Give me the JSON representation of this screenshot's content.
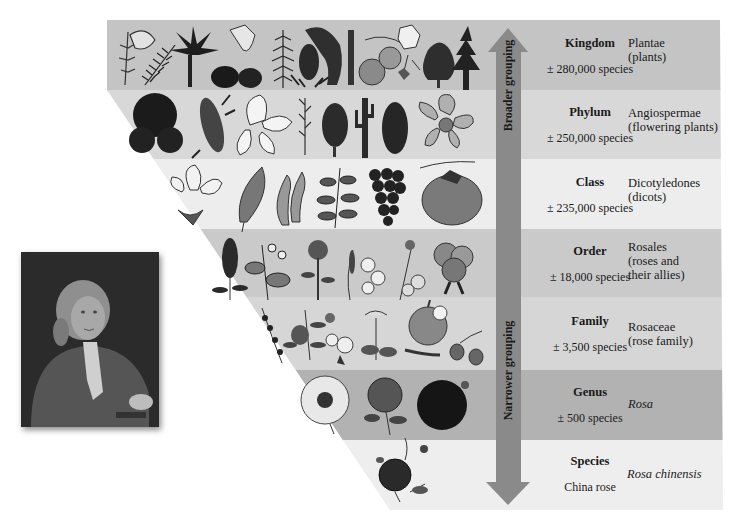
{
  "figure": {
    "arrow": {
      "top_label": "Broader grouping",
      "bottom_label": "Narrower grouping",
      "color": "#8a8a8a"
    },
    "portrait": {
      "subject": "portrait-of-linnaeus",
      "description": "18th-century painted portrait of a man with a powdered wig"
    },
    "levels": [
      {
        "rank": "Kingdom",
        "count": "± 280,000 species",
        "taxon_line1": "Plantae",
        "taxon_line2": "(plants)",
        "taxon_line3": "",
        "italic": false,
        "color": "#c4c4c4",
        "illustrations": [
          "moss-sprig",
          "fern-frond",
          "palm-tree",
          "horsetail-cone",
          "conifer-branch",
          "pineapple",
          "cycad-cone",
          "orange-fruit",
          "orchid-flower",
          "pine-cone",
          "spruce-tree"
        ]
      },
      {
        "rank": "Phylum",
        "count": "± 250,000 species",
        "taxon_line1": "Angiospermae",
        "taxon_line2": "(flowering plants)",
        "taxon_line3": "",
        "italic": false,
        "color": "#d8d8d8",
        "illustrations": [
          "fan-palm",
          "corn-cob",
          "lily-flower",
          "grass-spike",
          "pine-cone",
          "saguaro-cactus",
          "fir-cone",
          "orchid-bloom"
        ]
      },
      {
        "rank": "Class",
        "count": "± 235,000 species",
        "taxon_line1": "Dicotyledones",
        "taxon_line2": "(dicots)",
        "taxon_line3": "",
        "italic": false,
        "color": "#ededed",
        "illustrations": [
          "magnolia-flower",
          "beech-leaf",
          "bean-pod",
          "leafy-branch",
          "grape-cluster",
          "persimmon-fruit"
        ]
      },
      {
        "rank": "Order",
        "count": "± 18,000 species",
        "taxon_line1": "Rosales",
        "taxon_line2": "(roses and",
        "taxon_line3": "their allies)",
        "italic": false,
        "color": "#cacaca",
        "illustrations": [
          "spiraea-spike",
          "bramble-branch",
          "hawthorn-sprig",
          "orchid-tree-flower",
          "cherry-blossom",
          "hydrangea-cluster"
        ]
      },
      {
        "rank": "Family",
        "count": "± 3,500 species",
        "taxon_line1": "Rosaceae",
        "taxon_line2": "(rose family)",
        "taxon_line3": "",
        "italic": false,
        "color": "#d6d6d6",
        "illustrations": [
          "cotoneaster-sprig",
          "peach-branch",
          "apple-blossom",
          "rowan-cluster",
          "apple-fruit",
          "rose-hips"
        ]
      },
      {
        "rank": "Genus",
        "count": "± 500 species",
        "taxon_line1": "Rosa",
        "taxon_line2": "",
        "taxon_line3": "",
        "italic": true,
        "color": "#b2b2b2",
        "illustrations": [
          "wild-rose",
          "garden-rose",
          "dark-rose"
        ]
      },
      {
        "rank": "Species",
        "count": "China rose",
        "taxon_line1": "Rosa chinensis",
        "taxon_line2": "",
        "taxon_line3": "",
        "italic": true,
        "color": "#eeeeee",
        "illustrations": [
          "china-rose"
        ]
      }
    ]
  }
}
